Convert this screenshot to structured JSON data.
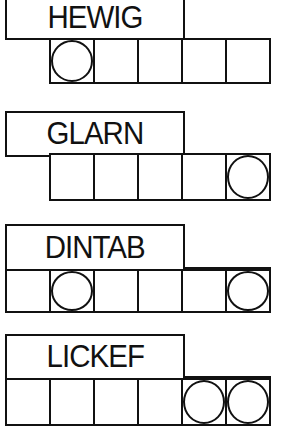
{
  "puzzles": [
    {
      "scrambled": "HEWIG",
      "num_cells": 5,
      "circled_cells": [
        1
      ]
    },
    {
      "scrambled": "GLARN",
      "num_cells": 5,
      "circled_cells": [
        5
      ]
    },
    {
      "scrambled": "DINTAB",
      "num_cells": 6,
      "circled_cells": [
        2,
        6
      ]
    },
    {
      "scrambled": "LICKEF",
      "num_cells": 6,
      "circled_cells": [
        5,
        6
      ]
    }
  ]
}
